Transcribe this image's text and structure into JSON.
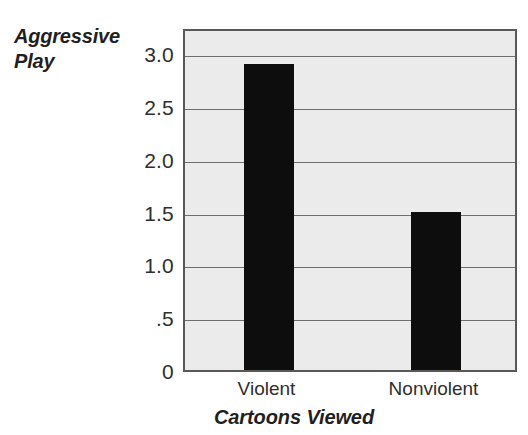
{
  "chart_data": {
    "type": "bar",
    "title": "",
    "subtitle": "",
    "categories": [
      "Violent",
      "Nonviolent"
    ],
    "values": [
      2.9,
      1.5
    ],
    "series": [
      {
        "name": "Aggressive Play",
        "values": [
          2.9,
          1.5
        ]
      }
    ],
    "xlabel": "Cartoons Viewed",
    "ylabel": "Aggressive Play",
    "ylim": [
      0,
      3.25
    ],
    "xlim": [
      0,
      2
    ],
    "yticks": [
      0,
      0.5,
      1.0,
      1.5,
      2.0,
      2.5,
      3.0
    ],
    "ytick_labels": [
      "0",
      ".5",
      "1.0",
      "1.5",
      "2.0",
      "2.5",
      "3.0"
    ],
    "grid": true,
    "grid_axis": "y",
    "legend": false,
    "legend_position": "none",
    "bar_color": "#0d0d0d",
    "plot_background": "#ebebeb",
    "gridline_color": "#6d6d6d",
    "axis_border_color": "#585858",
    "annotations": []
  },
  "axes": {
    "y_title_lines": [
      "Aggressive",
      "Play"
    ],
    "x_title": "Cartoons Viewed"
  }
}
